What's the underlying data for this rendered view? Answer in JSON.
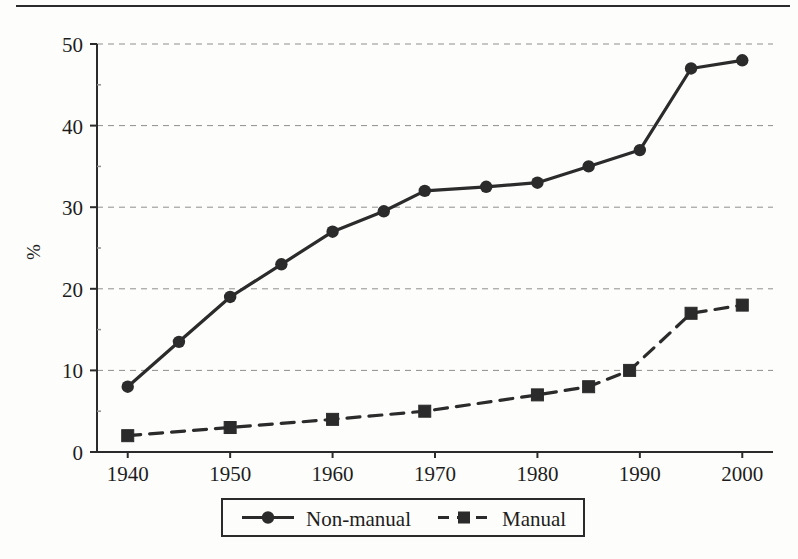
{
  "chart_data": {
    "type": "line",
    "title": "",
    "subtitle": "",
    "xlabel": "",
    "ylabel": "%",
    "xlim": [
      1937,
      2003
    ],
    "ylim": [
      0,
      50
    ],
    "grid": "horizontal-dashed",
    "legend_position": "bottom-center",
    "x_tick_labels": [
      "1940",
      "1950",
      "1960",
      "1970",
      "1980",
      "1990",
      "2000"
    ],
    "x_ticks": [
      1940,
      1950,
      1960,
      1970,
      1980,
      1990,
      2000
    ],
    "y_tick_labels": [
      "0",
      "10",
      "20",
      "30",
      "40",
      "50"
    ],
    "y_ticks": [
      0,
      10,
      20,
      30,
      40,
      50
    ],
    "series": [
      {
        "name": "Non-manual",
        "marker": "circle",
        "line_style": "solid",
        "color": "#2b2b2b",
        "points": [
          {
            "x": 1940,
            "y": 8
          },
          {
            "x": 1945,
            "y": 13.5
          },
          {
            "x": 1950,
            "y": 19
          },
          {
            "x": 1955,
            "y": 23
          },
          {
            "x": 1960,
            "y": 27
          },
          {
            "x": 1965,
            "y": 29.5
          },
          {
            "x": 1969,
            "y": 32
          },
          {
            "x": 1975,
            "y": 32.5
          },
          {
            "x": 1980,
            "y": 33
          },
          {
            "x": 1985,
            "y": 35
          },
          {
            "x": 1990,
            "y": 37
          },
          {
            "x": 1995,
            "y": 47
          },
          {
            "x": 2000,
            "y": 48
          }
        ]
      },
      {
        "name": "Manual",
        "marker": "square",
        "line_style": "dashed",
        "color": "#2b2b2b",
        "points": [
          {
            "x": 1940,
            "y": 2
          },
          {
            "x": 1950,
            "y": 3
          },
          {
            "x": 1960,
            "y": 4
          },
          {
            "x": 1969,
            "y": 5
          },
          {
            "x": 1980,
            "y": 7
          },
          {
            "x": 1985,
            "y": 8
          },
          {
            "x": 1989,
            "y": 10
          },
          {
            "x": 1995,
            "y": 17
          },
          {
            "x": 2000,
            "y": 18
          }
        ]
      }
    ]
  },
  "legend": {
    "entries": [
      {
        "label": "Non-manual",
        "marker": "circle",
        "line_style": "solid"
      },
      {
        "label": "Manual",
        "marker": "square",
        "line_style": "dashed"
      }
    ]
  },
  "colors": {
    "ink": "#2b2b2b",
    "grid": "#8f8f8f",
    "page": "#fdfdfb"
  }
}
